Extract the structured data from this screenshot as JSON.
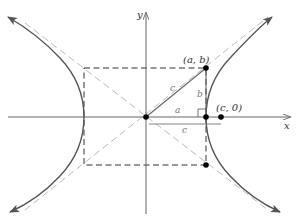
{
  "diagram": {
    "axes": {
      "x_label": "x",
      "y_label": "y"
    },
    "points": {
      "ab_label": "(a, b)",
      "c0_label": "(c, 0)"
    },
    "segment_labels": {
      "hypotenuse": "c",
      "vertical": "b",
      "horizontal": "a",
      "bracket": "c"
    },
    "colors": {
      "curve": "#555555",
      "axis": "#666666",
      "asymptote": "#bbbbbb",
      "rectangle": "#333333",
      "point": "#000000",
      "triangle": "#666666"
    }
  }
}
